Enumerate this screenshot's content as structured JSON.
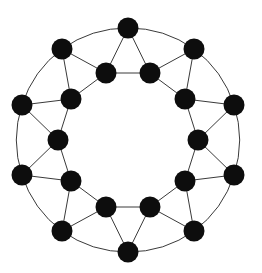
{
  "figure": {
    "title": "",
    "caption": "",
    "background_color": "#ffffff"
  },
  "chart_data": {
    "type": "diagram",
    "diagram_type": "graph",
    "title": "",
    "node_count": 20,
    "edge_count": 40,
    "layout": {
      "center_x": 128,
      "center_y": 140,
      "outer_radius": 112,
      "inner_radius": 70,
      "outer_node_count": 10,
      "inner_node_count": 10,
      "angle_step_degrees": 36,
      "outer_start_angle_degrees": -90,
      "inner_start_angle_degrees": -108,
      "node_radius": 10.5
    },
    "style": {
      "node_color": "#0d0d0d",
      "node_shape": "circle",
      "edge_color": "#3a3a3a",
      "edge_width": 1,
      "directed": false,
      "weighted": false,
      "labels_visible": false,
      "grid": false,
      "axes": false,
      "legend": false
    },
    "nodes": [
      {
        "id": "O0",
        "ring": "outer",
        "index": 0,
        "angle_degrees": -90,
        "x": 128,
        "y": 28
      },
      {
        "id": "O1",
        "ring": "outer",
        "index": 1,
        "angle_degrees": -54,
        "x": 194,
        "y": 49
      },
      {
        "id": "O2",
        "ring": "outer",
        "index": 2,
        "angle_degrees": -18,
        "x": 234,
        "y": 105
      },
      {
        "id": "O3",
        "ring": "outer",
        "index": 3,
        "angle_degrees": 18,
        "x": 234,
        "y": 175
      },
      {
        "id": "O4",
        "ring": "outer",
        "index": 4,
        "angle_degrees": 54,
        "x": 194,
        "y": 231
      },
      {
        "id": "O5",
        "ring": "outer",
        "index": 5,
        "angle_degrees": 90,
        "x": 128,
        "y": 252
      },
      {
        "id": "O6",
        "ring": "outer",
        "index": 6,
        "angle_degrees": 126,
        "x": 62,
        "y": 231
      },
      {
        "id": "O7",
        "ring": "outer",
        "index": 7,
        "angle_degrees": 162,
        "x": 22,
        "y": 175
      },
      {
        "id": "O8",
        "ring": "outer",
        "index": 8,
        "angle_degrees": 198,
        "x": 22,
        "y": 105
      },
      {
        "id": "O9",
        "ring": "outer",
        "index": 9,
        "angle_degrees": 234,
        "x": 62,
        "y": 49
      },
      {
        "id": "I0",
        "ring": "inner",
        "index": 0,
        "angle_degrees": -108,
        "x": 106,
        "y": 73
      },
      {
        "id": "I1",
        "ring": "inner",
        "index": 1,
        "angle_degrees": -72,
        "x": 150,
        "y": 73
      },
      {
        "id": "I2",
        "ring": "inner",
        "index": 2,
        "angle_degrees": -36,
        "x": 185,
        "y": 99
      },
      {
        "id": "I3",
        "ring": "inner",
        "index": 3,
        "angle_degrees": 0,
        "x": 198,
        "y": 140
      },
      {
        "id": "I4",
        "ring": "inner",
        "index": 4,
        "angle_degrees": 36,
        "x": 185,
        "y": 181
      },
      {
        "id": "I5",
        "ring": "inner",
        "index": 5,
        "angle_degrees": 72,
        "x": 150,
        "y": 207
      },
      {
        "id": "I6",
        "ring": "inner",
        "index": 6,
        "angle_degrees": 108,
        "x": 106,
        "y": 207
      },
      {
        "id": "I7",
        "ring": "inner",
        "index": 7,
        "angle_degrees": 144,
        "x": 71,
        "y": 181
      },
      {
        "id": "I8",
        "ring": "inner",
        "index": 8,
        "angle_degrees": 180,
        "x": 58,
        "y": 140
      },
      {
        "id": "I9",
        "ring": "inner",
        "index": 9,
        "angle_degrees": 216,
        "x": 71,
        "y": 99
      }
    ],
    "edges": [
      {
        "source": "O0",
        "target": "O1",
        "type": "outer-ring",
        "curved": true
      },
      {
        "source": "O1",
        "target": "O2",
        "type": "outer-ring",
        "curved": true
      },
      {
        "source": "O2",
        "target": "O3",
        "type": "outer-ring",
        "curved": true
      },
      {
        "source": "O3",
        "target": "O4",
        "type": "outer-ring",
        "curved": true
      },
      {
        "source": "O4",
        "target": "O5",
        "type": "outer-ring",
        "curved": true
      },
      {
        "source": "O5",
        "target": "O6",
        "type": "outer-ring",
        "curved": true
      },
      {
        "source": "O6",
        "target": "O7",
        "type": "outer-ring",
        "curved": true
      },
      {
        "source": "O7",
        "target": "O8",
        "type": "outer-ring",
        "curved": true
      },
      {
        "source": "O8",
        "target": "O9",
        "type": "outer-ring",
        "curved": true
      },
      {
        "source": "O9",
        "target": "O0",
        "type": "outer-ring",
        "curved": true
      },
      {
        "source": "I0",
        "target": "I1",
        "type": "inner-ring",
        "curved": false
      },
      {
        "source": "I1",
        "target": "I2",
        "type": "inner-ring",
        "curved": false
      },
      {
        "source": "I2",
        "target": "I3",
        "type": "inner-ring",
        "curved": false
      },
      {
        "source": "I3",
        "target": "I4",
        "type": "inner-ring",
        "curved": false
      },
      {
        "source": "I4",
        "target": "I5",
        "type": "inner-ring",
        "curved": false
      },
      {
        "source": "I5",
        "target": "I6",
        "type": "inner-ring",
        "curved": false
      },
      {
        "source": "I6",
        "target": "I7",
        "type": "inner-ring",
        "curved": false
      },
      {
        "source": "I7",
        "target": "I8",
        "type": "inner-ring",
        "curved": false
      },
      {
        "source": "I8",
        "target": "I9",
        "type": "inner-ring",
        "curved": false
      },
      {
        "source": "I9",
        "target": "I0",
        "type": "inner-ring",
        "curved": false
      },
      {
        "source": "O0",
        "target": "I0",
        "type": "spoke",
        "curved": false
      },
      {
        "source": "O0",
        "target": "I1",
        "type": "spoke",
        "curved": false
      },
      {
        "source": "O1",
        "target": "I1",
        "type": "spoke",
        "curved": false
      },
      {
        "source": "O1",
        "target": "I2",
        "type": "spoke",
        "curved": false
      },
      {
        "source": "O2",
        "target": "I2",
        "type": "spoke",
        "curved": false
      },
      {
        "source": "O2",
        "target": "I3",
        "type": "spoke",
        "curved": false
      },
      {
        "source": "O3",
        "target": "I3",
        "type": "spoke",
        "curved": false
      },
      {
        "source": "O3",
        "target": "I4",
        "type": "spoke",
        "curved": false
      },
      {
        "source": "O4",
        "target": "I4",
        "type": "spoke",
        "curved": false
      },
      {
        "source": "O4",
        "target": "I5",
        "type": "spoke",
        "curved": false
      },
      {
        "source": "O5",
        "target": "I5",
        "type": "spoke",
        "curved": false
      },
      {
        "source": "O5",
        "target": "I6",
        "type": "spoke",
        "curved": false
      },
      {
        "source": "O6",
        "target": "I6",
        "type": "spoke",
        "curved": false
      },
      {
        "source": "O6",
        "target": "I7",
        "type": "spoke",
        "curved": false
      },
      {
        "source": "O7",
        "target": "I7",
        "type": "spoke",
        "curved": false
      },
      {
        "source": "O7",
        "target": "I8",
        "type": "spoke",
        "curved": false
      },
      {
        "source": "O8",
        "target": "I8",
        "type": "spoke",
        "curved": false
      },
      {
        "source": "O8",
        "target": "I9",
        "type": "spoke",
        "curved": false
      },
      {
        "source": "O9",
        "target": "I9",
        "type": "spoke",
        "curved": false
      },
      {
        "source": "O9",
        "target": "I0",
        "type": "spoke",
        "curved": false
      }
    ]
  }
}
